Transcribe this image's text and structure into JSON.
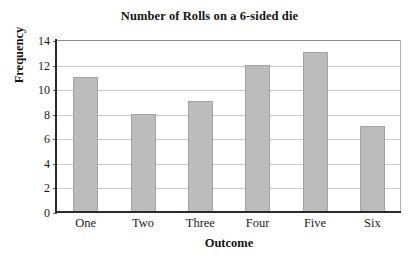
{
  "chart_data": {
    "type": "bar",
    "title": "Number of Rolls on a 6-sided die",
    "xlabel": "Outcome",
    "ylabel": "Frequency",
    "categories": [
      "One",
      "Two",
      "Three",
      "Four",
      "Five",
      "Six"
    ],
    "values": [
      11,
      8,
      9,
      12,
      13,
      7
    ],
    "ylim": [
      0,
      14
    ],
    "ytick_labels": [
      "0",
      "2",
      "4",
      "6",
      "8",
      "10",
      "12",
      "14"
    ],
    "ytick_values": [
      0,
      2,
      4,
      6,
      8,
      10,
      12,
      14
    ],
    "grid": true,
    "legend": false,
    "legend_position": "none",
    "bar_color": "#bcbcbc",
    "bar_edge_color": "#a3a3a3",
    "gridline_color": "#c9c9c9",
    "axis_color": "#2b2b2b",
    "background_color": "#ffffff"
  }
}
